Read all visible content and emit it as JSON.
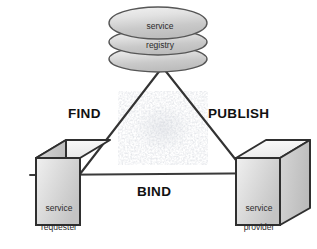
{
  "diagram": {
    "type": "soa-triangle",
    "background_color": "#ffffff",
    "line_color": "#333333",
    "nodes": [
      {
        "id": "registry",
        "shape": "cylinder-stack",
        "label_line1": "service",
        "label_line2": "registry",
        "fill_color": "#d8d8d8"
      },
      {
        "id": "requester",
        "shape": "cube",
        "label_line1": "service",
        "label_line2": "requester",
        "fill_color": "#d4d4d4"
      },
      {
        "id": "provider",
        "shape": "cube",
        "label_line1": "service",
        "label_line2": "provider",
        "fill_color": "#d4d4d4"
      }
    ],
    "edges": [
      {
        "id": "find",
        "label": "FIND",
        "from": "requester",
        "to": "registry"
      },
      {
        "id": "publish",
        "label": "PUBLISH",
        "from": "provider",
        "to": "registry"
      },
      {
        "id": "bind",
        "label": "BIND",
        "from": "requester",
        "to": "provider"
      }
    ]
  }
}
